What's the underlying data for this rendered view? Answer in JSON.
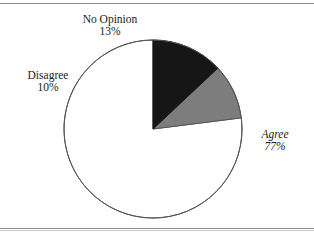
{
  "page": {
    "background_color": "#ffffff",
    "rule_color": "#8d8d8d"
  },
  "chart_data": {
    "type": "pie",
    "title": "",
    "subtitle": "",
    "xlabel": "",
    "ylabel": "",
    "grid": false,
    "legend_position": "none",
    "labels_inline": true,
    "start_angle_deg": 90,
    "direction": "counterclockwise",
    "center": {
      "x": 153,
      "y": 129
    },
    "radius": 89,
    "categories": [
      "Agree",
      "Disagree",
      "No Opinion"
    ],
    "values": [
      77,
      10,
      13
    ],
    "units": "%",
    "slices": [
      {
        "name": "Agree",
        "value": 77,
        "value_label": "77%",
        "name_label": "Agree",
        "color": "#ffffff",
        "stroke": "#555555",
        "label_style": "italic",
        "label_position": "right-outside"
      },
      {
        "name": "Disagree",
        "value": 10,
        "value_label": "10%",
        "name_label": "Disagree",
        "color": "#7d7d7d",
        "stroke": "#555555",
        "label_style": "roman",
        "label_position": "left-outside"
      },
      {
        "name": "No Opinion",
        "value": 13,
        "value_label": "13%",
        "name_label": "No Opinion",
        "color": "#161616",
        "stroke": "#161616",
        "label_style": "roman",
        "label_position": "top-outside"
      }
    ]
  },
  "labels": {
    "no_opinion": {
      "name": "No Opinion",
      "pct": "13%"
    },
    "disagree": {
      "name": "Disagree",
      "pct": "10%"
    },
    "agree": {
      "name": "Agree",
      "pct": "77%"
    }
  }
}
